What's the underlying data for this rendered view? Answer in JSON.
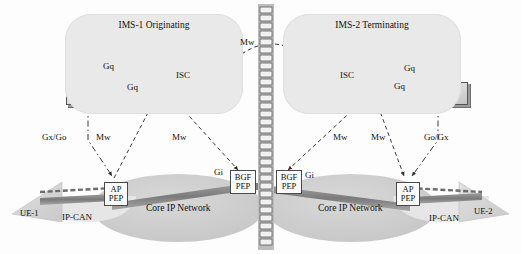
{
  "diagram": {
    "domains": [
      {
        "id": "ims1",
        "label": "IMS-1 Originating"
      },
      {
        "id": "ims2",
        "label": "IMS-2 Terminating"
      }
    ],
    "nodes": {
      "ims1_as": {
        "label": "AS"
      },
      "ims1_cscf": {
        "label": "CSCF"
      },
      "ims1_pdf_line1": "PDF",
      "ims1_pdf_line2": "PCRF",
      "ims2_as": {
        "label": "AS"
      },
      "ims2_cscf": {
        "label": "CSCF"
      },
      "ims2_pdf_line1": "PDF",
      "ims2_pdf_line2": "PCRF"
    },
    "pep_boxes": {
      "ap_left_line1": "AP",
      "ap_left_line2": "PEP",
      "bgf_left_line1": "BGF",
      "bgf_left_line2": "PEP",
      "bgf_right_line1": "BGF",
      "bgf_right_line2": "PEP",
      "ap_right_line1": "AP",
      "ap_right_line2": "PEP"
    },
    "transport": {
      "core_left": "Core IP Network",
      "core_right": "Core IP Network",
      "ipcan_left": "IP-CAN",
      "ipcan_right": "IP-CAN"
    },
    "terminals": [
      {
        "id": "ue1",
        "label": "UE-1"
      },
      {
        "id": "ue2",
        "label": "UE-2"
      }
    ],
    "interfaces": {
      "ims1_gq_as": "Gq",
      "ims1_gq_cscf": "Gq",
      "ims1_isc": "ISC",
      "ims2_gq_as": "Gq",
      "ims2_gq_cscf": "Gq",
      "ims2_isc": "ISC",
      "mw_top": "Mw",
      "mw_left_1": "Mw",
      "mw_left_2": "Mw",
      "mw_right_1": "Mw",
      "mw_right_2": "Mw",
      "gxgo_left": "Gx/Go",
      "gogx_right": "Go/Gx",
      "gi_left": "Gi",
      "gi_right": "Gi"
    },
    "colors": {
      "cloud": "#e9e9e9",
      "core_network": "#cfcfcf",
      "ipcan": "#e4e4e4",
      "node_fill": "#d9d9d9",
      "node_border": "#555555",
      "pep_fill": "#fbfbfb",
      "link_stroke": "#3a3a3a",
      "band": "#8a8a8a",
      "text": "#111111",
      "background": "#fdfdfd"
    }
  }
}
